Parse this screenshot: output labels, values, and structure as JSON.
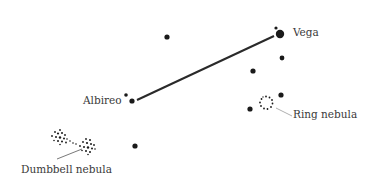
{
  "diagram": {
    "type": "star-chart",
    "colors": {
      "star": "#1a1a1a",
      "line": "#2a2a2a",
      "label": "#3a3a3a",
      "leader": "#9a9a9a"
    },
    "labels": {
      "vega": "Vega",
      "albireo": "Albireo",
      "ring_nebula": "Ring nebula",
      "dumbbell_nebula": "Dumbbell nebula"
    },
    "connection": {
      "from": "Albireo",
      "to": "Vega"
    }
  }
}
